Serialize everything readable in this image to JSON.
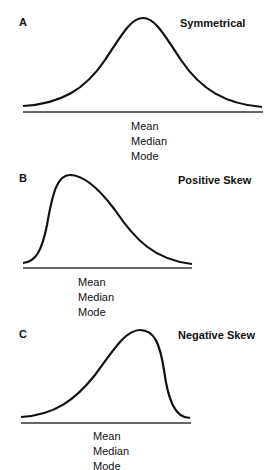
{
  "panels": [
    {
      "letter": "A",
      "title": "Symmetrical",
      "labels": [
        "Mean",
        "Median",
        "Mode"
      ]
    },
    {
      "letter": "B",
      "title": "Positive Skew",
      "labels": [
        "Mean",
        "Median",
        "Mode"
      ]
    },
    {
      "letter": "C",
      "title": "Negative Skew",
      "labels": [
        "Mean",
        "Median",
        "Mode"
      ]
    }
  ],
  "colors": {
    "curve": "#111111",
    "baseline": "#333333",
    "background": "#ffffff"
  }
}
